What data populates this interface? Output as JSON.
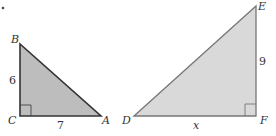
{
  "figure": {
    "marker": "•",
    "triangle_small": {
      "vertices": {
        "B": "B",
        "C": "C",
        "A": "A"
      },
      "side_BC": "6",
      "side_CA": "7",
      "right_angle_at": "C",
      "fill": "#bdbdbd",
      "stroke": "#333333"
    },
    "triangle_large": {
      "vertices": {
        "D": "D",
        "E": "E",
        "F": "F"
      },
      "side_EF": "9",
      "side_DF": "x",
      "right_angle_at": "F",
      "fill": "#d9d9d9",
      "stroke": "#777777"
    }
  }
}
